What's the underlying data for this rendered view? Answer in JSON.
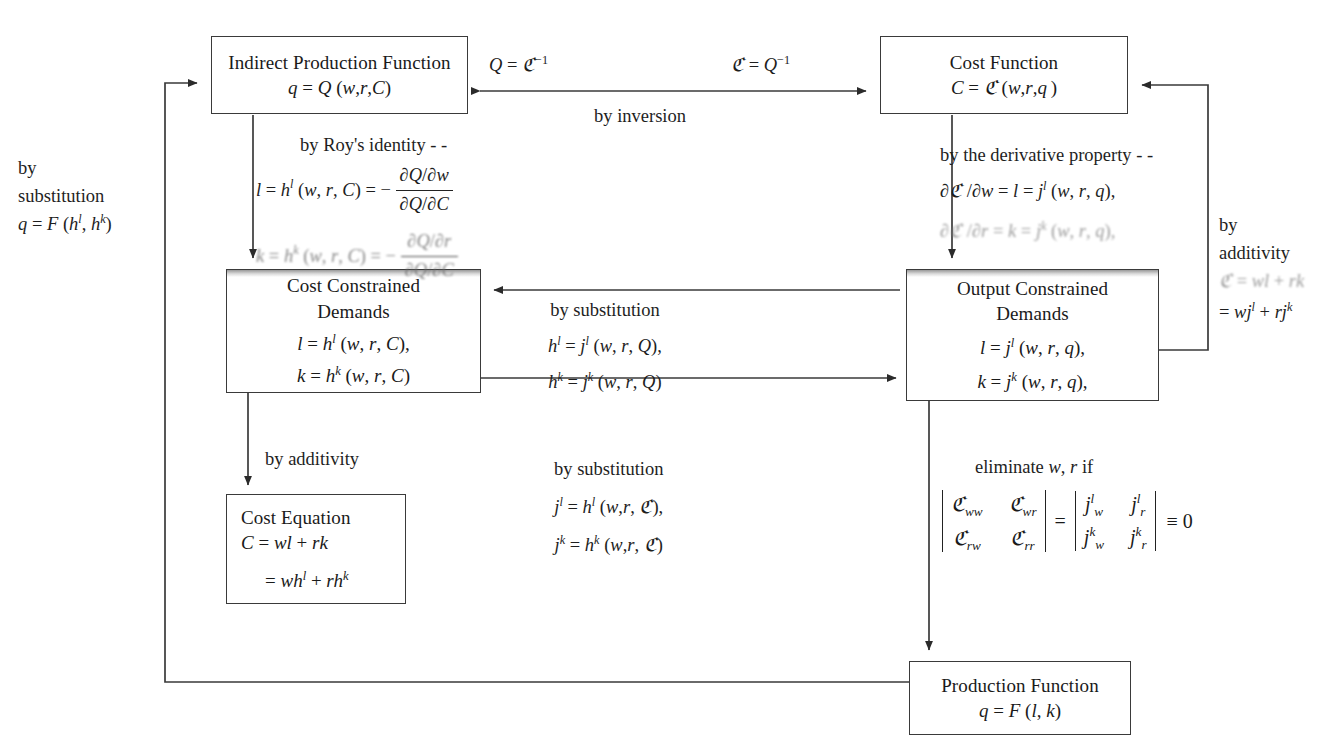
{
  "diagram": {
    "type": "flow-diagram",
    "background": "#ffffff",
    "line_color": "#3a3a3a"
  },
  "boxes": {
    "indirect_production_function": {
      "title": "Indirect Production Function",
      "equation": "q = Q (w,r,C)",
      "x": 211,
      "y": 36,
      "w": 257,
      "h": 78
    },
    "cost_function": {
      "title": "Cost Function",
      "equation": "C = ℭ (w,r,q)",
      "x": 880,
      "y": 36,
      "w": 248,
      "h": 78
    },
    "cost_constrained_demands": {
      "title_line1": "Cost Constrained",
      "title_line2": "Demands",
      "equation1": "l = h^l (w, r, C),",
      "equation2": "k = h^k (w, r, C)",
      "x": 226,
      "y": 269,
      "w": 255,
      "h": 124
    },
    "output_constrained_demands": {
      "title_line1": "Output Constrained",
      "title_line2": "Demands",
      "equation1": "l = j^l (w, r, q),",
      "equation2": "k = j^k (w, r, q),",
      "x": 906,
      "y": 269,
      "w": 253,
      "h": 132
    },
    "cost_equation": {
      "title": "Cost Equation",
      "equation1": "C = wl + rk",
      "equation2": "= wh^l + rh^k",
      "x": 226,
      "y": 494,
      "w": 180,
      "h": 110
    },
    "production_function": {
      "title": "Production Function",
      "equation": "q = F (l, k)",
      "x": 909,
      "y": 661,
      "w": 222,
      "h": 74
    }
  },
  "labels": {
    "inversion_left": "Q = ℭ⁻¹",
    "inversion_right": "ℭ = Q⁻¹",
    "inversion_caption": "by inversion",
    "roys_identity": "by Roy's identity - -",
    "roys_eq1_lhs": "l = h^l (w, r, C) = −",
    "roys_eq1_num": "∂Q/∂w",
    "roys_eq1_den": "∂Q/∂C",
    "roys_eq2_lhs": "k = h^k (w, r, C) = −",
    "roys_eq2_num": "∂Q/∂r",
    "roys_eq2_den": "∂Q/∂C",
    "derivative_property": "by the derivative property - -",
    "derivative_eq1": "∂ℭ /∂w = l = j^l (w, r, q),",
    "derivative_eq2": "∂ℭ /∂r = k = j^k (w, r, q),",
    "left_substitution_line1": "by",
    "left_substitution_line2": "substitution",
    "left_substitution_line3": "q = F (h^l, h^k)",
    "right_additivity_line1": "by",
    "right_additivity_line2": "additivity",
    "right_additivity_line3": "ℭ = wl + rk",
    "right_additivity_line4": "= wj^l + rj^k",
    "mid_substitution_title": "by substitution",
    "mid_substitution_eq1": "h^l = j^l (w, r, Q),",
    "mid_substitution_eq2": "h^k = j^k (w, r, Q)",
    "by_additivity": "by additivity",
    "lower_substitution_title": "by substitution",
    "lower_substitution_eq1": "j^l = h^l (w,r, ℭ),",
    "lower_substitution_eq2": "j^k = h^k (w,r, ℭ)",
    "eliminate_title": "eliminate w, r if",
    "determinant_left": [
      "ℭ_ww",
      "ℭ_wr",
      "ℭ_rw",
      "ℭ_rr"
    ],
    "determinant_right": [
      "j^l_w",
      "j^l_r",
      "j^k_w",
      "j^k_r"
    ],
    "determinant_equals": "=",
    "determinant_result": "≡ 0"
  }
}
